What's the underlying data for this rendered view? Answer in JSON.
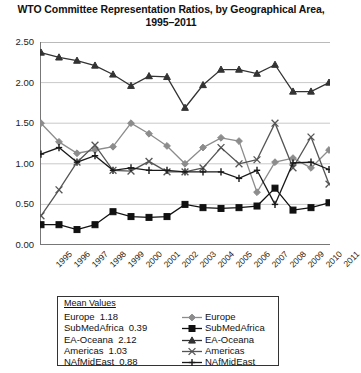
{
  "chart_data": {
    "type": "line",
    "title": "WTO Committee Representation Ratios, by Geographical Area, 1995–2011",
    "xlabel": "",
    "ylabel": "",
    "ylim": [
      0.0,
      2.5
    ],
    "ytick_labels": [
      "0.00",
      "0.50",
      "1.00",
      "1.50",
      "2.00",
      "2.50"
    ],
    "ytick_values": [
      0.0,
      0.5,
      1.0,
      1.5,
      2.0,
      2.5
    ],
    "grid": "horizontal",
    "legend_position": "below-plot-right",
    "categories": [
      "1995",
      "1996",
      "1997",
      "1998",
      "1999",
      "2000",
      "2001",
      "2002",
      "2003",
      "2004",
      "2005",
      "2006",
      "2007",
      "2008",
      "2009",
      "2010",
      "2011"
    ],
    "series": [
      {
        "name": "Europe",
        "mean": 1.18,
        "color": "#8c8c8c",
        "marker": "diamond",
        "values": [
          1.5,
          1.27,
          1.13,
          1.17,
          1.21,
          1.5,
          1.37,
          1.22,
          1.0,
          1.2,
          1.32,
          1.28,
          0.65,
          1.02,
          1.07,
          0.95,
          1.17
        ]
      },
      {
        "name": "SubMedAfrica",
        "mean": 0.39,
        "color": "#111111",
        "marker": "square",
        "values": [
          0.25,
          0.25,
          0.19,
          0.25,
          0.41,
          0.35,
          0.34,
          0.35,
          0.5,
          0.46,
          0.45,
          0.46,
          0.48,
          0.7,
          0.43,
          0.46,
          0.52
        ]
      },
      {
        "name": "EA-Oceana",
        "mean": 2.12,
        "color": "#333333",
        "marker": "triangle",
        "values": [
          2.37,
          2.31,
          2.27,
          2.21,
          2.1,
          1.96,
          2.08,
          2.07,
          1.69,
          1.97,
          2.16,
          2.16,
          2.11,
          2.22,
          1.89,
          1.89,
          2.0
        ]
      },
      {
        "name": "Americas",
        "mean": 1.03,
        "color": "#555555",
        "marker": "cross",
        "values": [
          0.36,
          0.68,
          1.02,
          1.23,
          0.92,
          0.91,
          1.03,
          0.9,
          0.9,
          0.95,
          1.2,
          1.0,
          1.05,
          1.5,
          0.95,
          1.33,
          0.75
        ]
      },
      {
        "name": "NAfMidEast",
        "mean": 0.88,
        "color": "#1a1a1a",
        "marker": "cross-bar",
        "values": [
          1.12,
          1.2,
          1.02,
          1.1,
          0.92,
          0.95,
          0.92,
          0.92,
          0.9,
          0.9,
          0.9,
          0.82,
          0.92,
          0.5,
          1.01,
          1.02,
          0.93
        ]
      }
    ],
    "legend_title": "Mean Values"
  }
}
